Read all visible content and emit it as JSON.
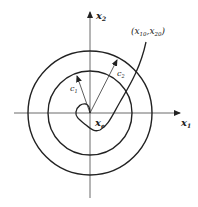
{
  "diagram": {
    "axes": {
      "x_label": "x",
      "x_sub": "1",
      "y_label": "x",
      "y_sub": "2"
    },
    "origin_label": {
      "main": "x",
      "sub": "e"
    },
    "initial_point_label": {
      "open": "(",
      "x": "x",
      "x_sub": "10",
      "comma": ",",
      "y": "x",
      "y_sub": "20",
      "close": ")"
    },
    "circles": [
      {
        "name": "inner",
        "radius_label": "c",
        "radius_sub": "1"
      },
      {
        "name": "outer",
        "radius_label": "c",
        "radius_sub": "2"
      }
    ],
    "colors": {
      "stroke": "#222222",
      "background": "#ffffff"
    }
  }
}
